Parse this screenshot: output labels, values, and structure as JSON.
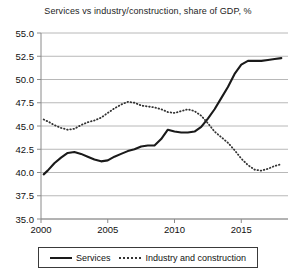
{
  "chart_data": {
    "type": "line",
    "title": "Services vs industry/construction, share of GDP, %",
    "xlabel": "",
    "ylabel": "",
    "xlim": [
      2000,
      2018.5
    ],
    "ylim": [
      35.0,
      55.0
    ],
    "grid": true,
    "legend_position": "bottom",
    "y_ticks": [
      "55.0",
      "52.5",
      "50.0",
      "47.5",
      "45.0",
      "42.5",
      "40.0",
      "37.5",
      "35.0"
    ],
    "y_tick_values": [
      55.0,
      52.5,
      50.0,
      47.5,
      45.0,
      42.5,
      40.0,
      37.5,
      35.0
    ],
    "x_ticks": [
      "2000",
      "2005",
      "2010",
      "2015"
    ],
    "x_tick_values": [
      2000,
      2005,
      2010,
      2015
    ],
    "x": [
      2000.2,
      2000.5,
      2001,
      2001.5,
      2002,
      2002.5,
      2003,
      2003.5,
      2004,
      2004.5,
      2005,
      2005.5,
      2006,
      2006.5,
      2007,
      2007.5,
      2008,
      2008.5,
      2009,
      2009.5,
      2010,
      2010.5,
      2011,
      2011.5,
      2012,
      2012.5,
      2013,
      2013.5,
      2014,
      2014.5,
      2015,
      2015.5,
      2016,
      2016.5,
      2017,
      2017.5,
      2018
    ],
    "series": [
      {
        "name": "Services",
        "style": "solid",
        "color": "#1a1a1a",
        "values": [
          39.8,
          40.2,
          41.0,
          41.6,
          42.1,
          42.2,
          42.0,
          41.7,
          41.4,
          41.2,
          41.3,
          41.7,
          42.0,
          42.3,
          42.5,
          42.8,
          42.9,
          42.9,
          43.6,
          44.6,
          44.4,
          44.3,
          44.3,
          44.4,
          44.9,
          45.8,
          46.8,
          48.0,
          49.2,
          50.6,
          51.6,
          52.0,
          52.0,
          52.0,
          52.1,
          52.2,
          52.3
        ]
      },
      {
        "name": "Industry and construction",
        "style": "dotted",
        "color": "#333333",
        "values": [
          45.7,
          45.5,
          45.1,
          44.8,
          44.6,
          44.7,
          45.1,
          45.4,
          45.6,
          45.9,
          46.4,
          46.9,
          47.3,
          47.6,
          47.5,
          47.2,
          47.1,
          47.0,
          46.8,
          46.5,
          46.4,
          46.6,
          46.8,
          46.6,
          46.1,
          45.3,
          44.4,
          43.8,
          43.2,
          42.4,
          41.5,
          40.8,
          40.3,
          40.2,
          40.4,
          40.7,
          40.9
        ]
      }
    ]
  },
  "legend": {
    "items": [
      {
        "label": "Services",
        "style": "solid"
      },
      {
        "label": "Industry and construction",
        "style": "dotted"
      }
    ]
  },
  "colors": {
    "services": "#1a1a1a",
    "industry": "#333333",
    "grid": "#b8b8b8",
    "axis": "#8a8a8a",
    "text": "#111111"
  }
}
